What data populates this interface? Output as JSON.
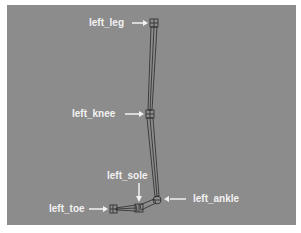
{
  "diagram": {
    "background_color": "#8c8c8c",
    "label_color": "#f2f2f2",
    "bone_color": "#2a2a2a",
    "labels": {
      "left_leg": "left_leg",
      "left_knee": "left_knee",
      "left_sole": "left_sole",
      "left_ankle": "left_ankle",
      "left_toe": "left_toe"
    },
    "joints": [
      {
        "name": "left_leg",
        "x": 154,
        "y": 23
      },
      {
        "name": "left_knee",
        "x": 150,
        "y": 114
      },
      {
        "name": "left_ankle",
        "x": 157,
        "y": 200
      },
      {
        "name": "left_sole",
        "x": 139,
        "y": 208
      },
      {
        "name": "left_toe",
        "x": 113,
        "y": 209
      }
    ]
  }
}
